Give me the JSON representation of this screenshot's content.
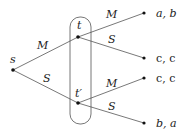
{
  "diagram": {
    "type": "game-tree",
    "nodes": {
      "root": {
        "label": "s"
      },
      "top": {
        "label": "t"
      },
      "bottom": {
        "label": "t′"
      }
    },
    "edges": {
      "root_to_top": {
        "label": "M"
      },
      "root_to_bottom": {
        "label": "S"
      },
      "top_M": {
        "label": "M"
      },
      "top_S": {
        "label": "S"
      },
      "bottom_M": {
        "label": "M"
      },
      "bottom_S": {
        "label": "S"
      }
    },
    "payoffs": {
      "leaf1": "a, b",
      "leaf2": "c, c",
      "leaf3": "c, c",
      "leaf4": "b, a"
    },
    "information_set": {
      "members": [
        "t",
        "t′"
      ]
    },
    "colors": {
      "line": "#555555",
      "node": "#111111"
    }
  }
}
